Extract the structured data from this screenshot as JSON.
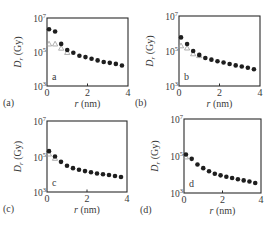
{
  "figure": {
    "panel_count": 4,
    "colors": {
      "axis": "#2b2b2b",
      "filled_marker": "#1e1e1e",
      "open_marker": "#9a9a9a",
      "text": "#3a3a3a"
    }
  },
  "chart_data": [
    {
      "type": "scatter",
      "panel_label": "(a)",
      "inset_label": "a",
      "xlabel": "r (nm)",
      "ylabel": "Dr (Gy)",
      "ylabel_main": "D",
      "ylabel_sub": "r",
      "ylabel_unit": " (Gy)",
      "yscale": "log",
      "xlim": [
        0,
        4
      ],
      "ylim": [
        1000,
        10000000
      ],
      "xticks": [
        0,
        2,
        4
      ],
      "xtick_labels": [
        "0",
        "2",
        "4"
      ],
      "yticks": [
        1000,
        100000,
        10000000
      ],
      "ytick_labels": [
        {
          "base": "10",
          "exp": "3"
        },
        {
          "base": "10",
          "exp": "5"
        },
        {
          "base": "10",
          "exp": "7"
        }
      ],
      "grid": false,
      "series": [
        {
          "name": "filled circles",
          "marker": "circle-filled",
          "x": [
            0.1,
            0.4,
            0.7,
            1.0,
            1.3,
            1.6,
            1.9,
            2.2,
            2.5,
            2.8,
            3.1,
            3.4,
            3.7
          ],
          "y": [
            2200000,
            1600000,
            300000,
            130000,
            90000,
            60000,
            50000,
            40000,
            32000,
            26000,
            23000,
            20000,
            16000
          ]
        },
        {
          "name": "open triangles",
          "marker": "triangle-open",
          "x": [
            0.1,
            0.4,
            0.7,
            1.0
          ],
          "y": [
            300000,
            300000,
            170000,
            95000
          ]
        }
      ],
      "box": {
        "x0": 47,
        "y0": 18,
        "x1": 128,
        "y1": 86
      }
    },
    {
      "type": "scatter",
      "panel_label": "(b)",
      "inset_label": "b",
      "xlabel": "r (nm)",
      "ylabel": "Dr (Gy)",
      "ylabel_main": "D",
      "ylabel_sub": "r",
      "ylabel_unit": " (Gy)",
      "yscale": "log",
      "xlim": [
        0,
        4
      ],
      "ylim": [
        1000,
        10000000
      ],
      "xticks": [
        0,
        2,
        4
      ],
      "xtick_labels": [
        "0",
        "2",
        "4"
      ],
      "yticks": [
        1000,
        100000,
        10000000
      ],
      "ytick_labels": [
        {
          "base": "10",
          "exp": "3"
        },
        {
          "base": "10",
          "exp": "5"
        },
        {
          "base": "10",
          "exp": "7"
        }
      ],
      "grid": false,
      "series": [
        {
          "name": "filled circles",
          "marker": "circle-filled",
          "x": [
            0.1,
            0.4,
            0.7,
            1.0,
            1.3,
            1.6,
            1.9,
            2.2,
            2.5,
            2.8,
            3.1,
            3.4,
            3.7
          ],
          "y": [
            600000,
            250000,
            100000,
            60000,
            40000,
            32000,
            26000,
            22000,
            18000,
            15000,
            13000,
            11000,
            9000
          ]
        },
        {
          "name": "open triangles",
          "marker": "triangle-open",
          "x": [
            0.1,
            0.4,
            0.7,
            1.0
          ],
          "y": [
            200000,
            150000,
            70000,
            55000
          ]
        }
      ],
      "box": {
        "x0": 179,
        "y0": 16,
        "x1": 260,
        "y1": 86
      }
    },
    {
      "type": "scatter",
      "panel_label": "(c)",
      "inset_label": "c",
      "xlabel": "r (nm)",
      "ylabel": "Dr (Gy)",
      "ylabel_main": "D",
      "ylabel_sub": "r",
      "ylabel_unit": " (Gy)",
      "yscale": "log",
      "xlim": [
        0,
        4
      ],
      "ylim": [
        1000,
        10000000
      ],
      "xticks": [
        0,
        2,
        4
      ],
      "xtick_labels": [
        "0",
        "2",
        "4"
      ],
      "yticks": [
        1000,
        100000,
        10000000
      ],
      "ytick_labels": [
        {
          "base": "10",
          "exp": "3"
        },
        {
          "base": "10",
          "exp": "5"
        },
        {
          "base": "10",
          "exp": "7"
        }
      ],
      "grid": false,
      "series": [
        {
          "name": "filled circles",
          "marker": "circle-filled",
          "x": [
            0.1,
            0.4,
            0.7,
            1.0,
            1.3,
            1.6,
            1.9,
            2.2,
            2.5,
            2.8,
            3.1,
            3.4,
            3.7
          ],
          "y": [
            200000,
            100000,
            50000,
            30000,
            22000,
            18000,
            15000,
            13000,
            11000,
            10000,
            9000,
            8000,
            7000
          ]
        },
        {
          "name": "open triangles",
          "marker": "triangle-open",
          "x": [
            0.1,
            0.4
          ],
          "y": [
            140000,
            80000
          ]
        }
      ],
      "box": {
        "x0": 47,
        "y0": 121,
        "x1": 127,
        "y1": 192
      }
    },
    {
      "type": "scatter",
      "panel_label": "(d)",
      "inset_label": "d",
      "xlabel": "r (nm)",
      "ylabel": "Dr (Gy)",
      "ylabel_main": "D",
      "ylabel_sub": "r",
      "ylabel_unit": " (Gy)",
      "yscale": "log",
      "xlim": [
        0,
        4
      ],
      "ylim": [
        1000,
        10000000
      ],
      "xticks": [
        0,
        2,
        4
      ],
      "xtick_labels": [
        "0",
        "2",
        "4"
      ],
      "yticks": [
        1000,
        100000,
        10000000
      ],
      "ytick_labels": [
        {
          "base": "10",
          "exp": "3"
        },
        {
          "base": "10",
          "exp": "5"
        },
        {
          "base": "10",
          "exp": "7"
        }
      ],
      "grid": false,
      "series": [
        {
          "name": "filled circles",
          "marker": "circle-filled",
          "x": [
            0.1,
            0.4,
            0.7,
            1.0,
            1.3,
            1.6,
            1.9,
            2.2,
            2.5,
            2.8,
            3.1,
            3.4,
            3.7
          ],
          "y": [
            120000,
            70000,
            35000,
            22000,
            15000,
            11000,
            9000,
            7500,
            6500,
            5500,
            4800,
            4200,
            3500
          ]
        },
        {
          "name": "open triangles",
          "marker": "triangle-open",
          "x": [
            0.1
          ],
          "y": [
            90000
          ]
        }
      ],
      "box": {
        "x0": 184,
        "y0": 119,
        "x1": 261,
        "y1": 193
      }
    }
  ]
}
